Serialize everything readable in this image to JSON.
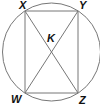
{
  "diagram": {
    "type": "circle-inscribed-rectangle",
    "circle": {
      "cx": 51.5,
      "cy": 52,
      "r": 49,
      "stroke": "#777777"
    },
    "rectangle": {
      "vertices": {
        "X": [
          25,
          11
        ],
        "Y": [
          78,
          11
        ],
        "Z": [
          78,
          93
        ],
        "W": [
          25,
          93
        ]
      },
      "stroke": "#777777"
    },
    "diagonals": [
      [
        "X",
        "Z"
      ],
      [
        "Y",
        "W"
      ]
    ],
    "intersection": {
      "name": "K",
      "point": [
        51.5,
        52
      ]
    },
    "labels": {
      "X": {
        "text": "X",
        "x": 19,
        "y": 9
      },
      "Y": {
        "text": "Y",
        "x": 79,
        "y": 9
      },
      "K": {
        "text": "K",
        "x": 47,
        "y": 42
      },
      "W": {
        "text": "W",
        "x": 11,
        "y": 103
      },
      "Z": {
        "text": "Z",
        "x": 79,
        "y": 104
      }
    }
  }
}
